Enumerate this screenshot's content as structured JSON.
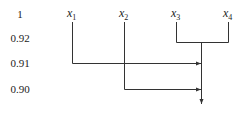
{
  "diagram": {
    "type": "dendrogram",
    "levels": [
      {
        "label": "1",
        "y": 14
      },
      {
        "label": "0.92",
        "y": 38
      },
      {
        "label": "0.91",
        "y": 63
      },
      {
        "label": "0.90",
        "y": 89
      }
    ],
    "variables": [
      {
        "name": "x",
        "sub": "1",
        "x": 72
      },
      {
        "name": "x",
        "sub": "2",
        "x": 124
      },
      {
        "name": "x",
        "sub": "3",
        "x": 176
      },
      {
        "name": "x",
        "sub": "4",
        "x": 228
      }
    ],
    "merges": [
      {
        "items": [
          "x3",
          "x4"
        ],
        "level": "0.92"
      },
      {
        "items": [
          "x1",
          "x3x4"
        ],
        "level": "0.91"
      },
      {
        "items": [
          "x2",
          "x1x3x4"
        ],
        "level": "0.90"
      }
    ],
    "line_color": "#333333"
  }
}
